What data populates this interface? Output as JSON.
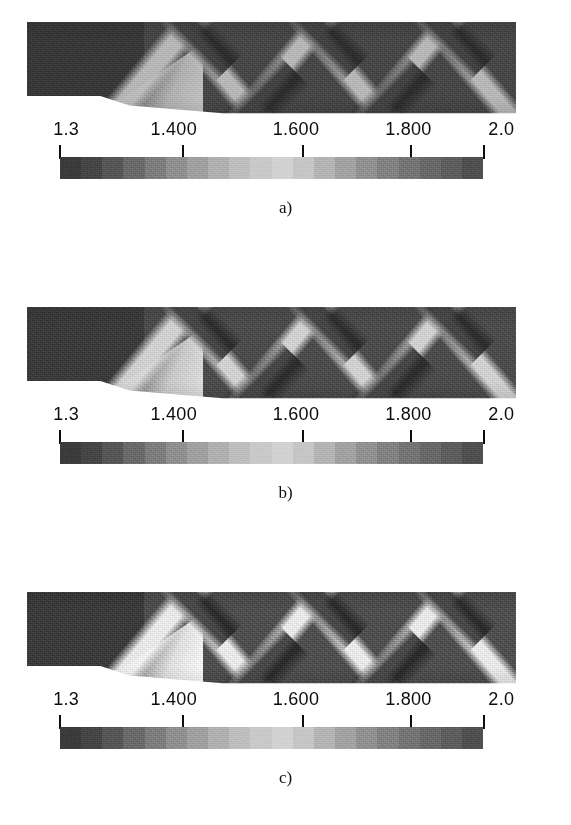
{
  "figure": {
    "type": "contour-panel-series",
    "panel_count": 3,
    "quantity": "Mach number"
  },
  "colorbar": {
    "min_label": "1.3",
    "max_label": "2.0",
    "min_value": 1.3,
    "max_value": 2.0,
    "tick_labels": [
      "1.3",
      "1.400",
      "1.600",
      "1.800",
      "2.0"
    ],
    "tick_values": [
      1.3,
      1.4,
      1.6,
      1.8,
      2.0
    ],
    "tick_positions_pct": [
      0,
      27.5,
      62.5,
      82.5,
      100
    ],
    "orientation": "horizontal",
    "style": "banded-grayscale",
    "band_colors": [
      "#3b3b3b",
      "#454545",
      "#565656",
      "#6a6a6a",
      "#7d7d7d",
      "#8f8f8f",
      "#a0a0a0",
      "#b0b0b0",
      "#bebebe",
      "#c9c9c9",
      "#d2d2d2",
      "#c6c6c6",
      "#b4b4b4",
      "#a2a2a2",
      "#919191",
      "#828282",
      "#747474",
      "#686868",
      "#5d5d5d",
      "#4f4f4f"
    ]
  },
  "panels": [
    {
      "caption": "a)",
      "variant": "v-a",
      "field_note": "dark inlet, oblique shock reflections"
    },
    {
      "caption": "b)",
      "variant": "v-b",
      "field_note": "dark inlet, oblique shock reflections"
    },
    {
      "caption": "c)",
      "variant": "v-c",
      "field_note": "dark inlet, oblique shock reflections"
    }
  ],
  "chart_data": {
    "type": "heatmap",
    "title": "",
    "xlabel": "",
    "ylabel": "",
    "colorbar_label": "",
    "legend_position": "below-each-panel",
    "grid": false,
    "zlim": [
      1.3,
      2.0
    ],
    "colorbar_ticks": [
      1.3,
      1.4,
      1.6,
      1.8,
      2.0
    ],
    "colorbar_tick_labels": [
      "1.3",
      "1.400",
      "1.600",
      "1.800",
      "2.0"
    ],
    "colormap": "grayscale-banded",
    "panels": [
      {
        "label": "a)",
        "description": "Mach contours in a supersonic duct with a compression ramp; oblique shocks reflect to form a diamond pattern",
        "inlet_value": 1.35,
        "peak_value": 1.95,
        "mean_value": 1.6
      },
      {
        "label": "b)",
        "description": "Mach contours, same duct, sharper shock resolution",
        "inlet_value": 1.35,
        "peak_value": 1.97,
        "mean_value": 1.64
      },
      {
        "label": "c)",
        "description": "Mach contours, same duct, highest contrast shock structure",
        "inlet_value": 1.35,
        "peak_value": 1.99,
        "mean_value": 1.68
      }
    ]
  }
}
